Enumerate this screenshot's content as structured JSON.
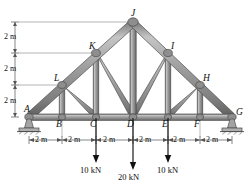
{
  "figure": {
    "structure_type": "howe-fink-roof-truss",
    "colors": {
      "member_fill": "#9a9a9a",
      "member_edge": "#5b5b5b",
      "member_highlight": "#c9c9c9",
      "joint_gusset": "#8d8d8d",
      "support": "#9e9e9e",
      "ground_line": "#4a4a4a",
      "dimension_line": "#555555",
      "load_arrow": "#111111",
      "label_text": "#111111"
    }
  },
  "joints": {
    "bottom_chord": [
      {
        "name": "A",
        "label": "A",
        "x_m": 0,
        "y_m": 0
      },
      {
        "name": "B",
        "label": "B",
        "x_m": 2,
        "y_m": 0
      },
      {
        "name": "C",
        "label": "C",
        "x_m": 4,
        "y_m": 0
      },
      {
        "name": "D",
        "label": "D",
        "x_m": 6,
        "y_m": 0
      },
      {
        "name": "E",
        "label": "E",
        "x_m": 8,
        "y_m": 0
      },
      {
        "name": "F",
        "label": "F",
        "x_m": 10,
        "y_m": 0
      },
      {
        "name": "G",
        "label": "G",
        "x_m": 12,
        "y_m": 0
      }
    ],
    "left_rafter": [
      {
        "name": "L",
        "label": "L",
        "x_m": 2,
        "y_m": 2
      },
      {
        "name": "K",
        "label": "K",
        "x_m": 4,
        "y_m": 4
      },
      {
        "name": "J",
        "label": "J",
        "x_m": 6,
        "y_m": 6
      }
    ],
    "right_rafter": [
      {
        "name": "I",
        "label": "I",
        "x_m": 8,
        "y_m": 4
      },
      {
        "name": "H",
        "label": "H",
        "x_m": 10,
        "y_m": 2
      }
    ]
  },
  "members": {
    "bottom_chord": [
      "A-B",
      "B-C",
      "C-D",
      "D-E",
      "E-F",
      "F-G"
    ],
    "top_chord_left": [
      "A-L",
      "L-K",
      "K-J"
    ],
    "top_chord_right": [
      "J-I",
      "I-H",
      "H-G"
    ],
    "verticals": [
      "L-B",
      "K-C",
      "J-D",
      "I-E",
      "H-F"
    ],
    "diagonals": [
      "L-C",
      "K-D",
      "I-D",
      "H-E"
    ]
  },
  "loads": [
    {
      "name": "load-at-C",
      "magnitude": "10 kN",
      "at_joint": "C",
      "direction": "down"
    },
    {
      "name": "load-at-D",
      "magnitude": "20 kN",
      "at_joint": "D",
      "direction": "down"
    },
    {
      "name": "load-at-E",
      "magnitude": "10 kN",
      "at_joint": "E",
      "direction": "down"
    }
  ],
  "supports": [
    {
      "name": "support-A",
      "at_joint": "A",
      "type": "pin"
    },
    {
      "name": "support-G",
      "at_joint": "G",
      "type": "pin"
    }
  ],
  "dimensions": {
    "vertical": {
      "segments": [
        "2 m",
        "2 m",
        "2 m"
      ],
      "total_height": "6 m"
    },
    "horizontal": {
      "segments": [
        "2 m",
        "2 m",
        "2 m",
        "2 m",
        "2 m",
        "2 m"
      ],
      "total_span": "12 m"
    }
  }
}
